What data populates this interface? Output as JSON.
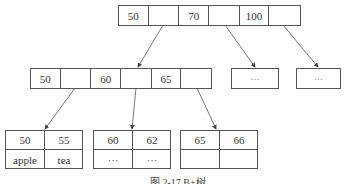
{
  "root": {
    "cells": [
      "50",
      "",
      "70",
      "",
      "100",
      ""
    ]
  },
  "internal": {
    "cells": [
      "50",
      "",
      "60",
      "",
      "65",
      ""
    ]
  },
  "placeholder_nodes": [
    {
      "label": "···"
    },
    {
      "label": "···"
    }
  ],
  "leaves": [
    {
      "keys": [
        "50",
        "55"
      ],
      "values": [
        "apple",
        "tea"
      ]
    },
    {
      "keys": [
        "60",
        "62"
      ],
      "values": [
        "···",
        "···"
      ]
    },
    {
      "keys": [
        "65",
        "66"
      ],
      "values": [
        "",
        ""
      ]
    }
  ],
  "caption": "图 2-17  B+树",
  "colors": {
    "line": "#555555",
    "text": "#333333",
    "background": "#ffffff"
  }
}
